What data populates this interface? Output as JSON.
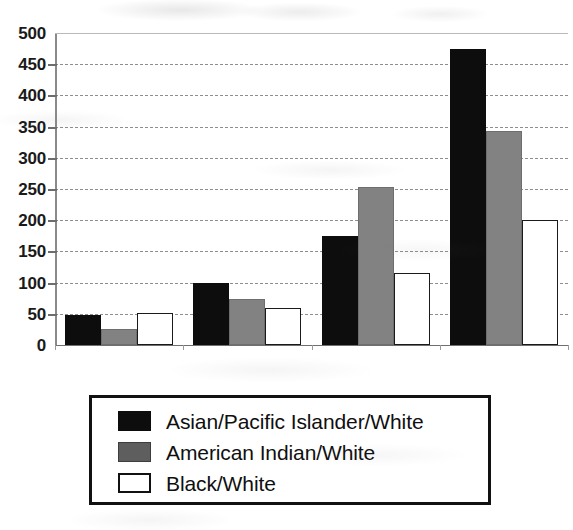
{
  "chart_data": {
    "type": "bar",
    "title": "",
    "subtitle": "",
    "xlabel": "",
    "ylabel": "",
    "categories": [
      "1",
      "2",
      "3",
      "4"
    ],
    "x_tick_labels": [
      "",
      "",
      "",
      ""
    ],
    "ylim": [
      0,
      500
    ],
    "y_ticks": [
      0,
      50,
      100,
      150,
      200,
      250,
      300,
      350,
      400,
      450,
      500
    ],
    "y_tick_labels": [
      "0",
      "50",
      "100",
      "150",
      "200",
      "250",
      "300",
      "350",
      "400",
      "450",
      "500"
    ],
    "grid": true,
    "grid_axis": "y",
    "grid_style": "dashed",
    "legend_position": "below-plot",
    "series": [
      {
        "name": "Asian/Pacific Islander/White",
        "color": "#0d0d0d",
        "swatch": "solid-black",
        "values": [
          48,
          99,
          175,
          475
        ]
      },
      {
        "name": "American Indian/White",
        "color": "#828282",
        "swatch": "solid-gray",
        "values": [
          25,
          74,
          253,
          343
        ]
      },
      {
        "name": "Black/White",
        "color": "#ffffff",
        "swatch": "outlined-white",
        "values": [
          52,
          60,
          115,
          200
        ]
      }
    ]
  },
  "colors": {
    "series_black": "#0d0d0d",
    "series_gray": "#828282",
    "series_white": "#ffffff",
    "axis": "#8a8a8a",
    "gridline": "#8d8d8d",
    "text": "#1a1a1a",
    "legend_border": "#111111",
    "background": "#ffffff"
  }
}
